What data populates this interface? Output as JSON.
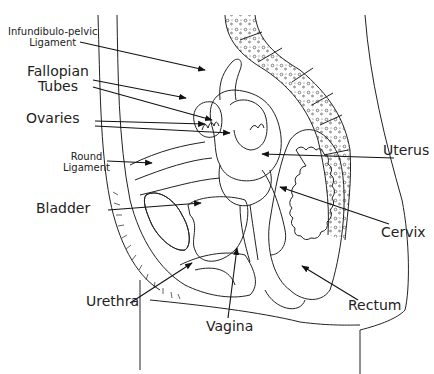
{
  "diagram": {
    "labels": {
      "infundibulo_line1": "Infundibulo-pelvic",
      "infundibulo_line2": "Ligament",
      "fallopian_line1": "Fallopian",
      "fallopian_line2": "Tubes",
      "ovaries": "Ovaries",
      "round_line1": "Round",
      "round_line2": "Ligament",
      "bladder": "Bladder",
      "urethra": "Urethra",
      "vagina": "Vagina",
      "uterus": "Uterus",
      "cervix": "Cervix",
      "rectum": "Rectum"
    },
    "stroke_color": "#222222",
    "background_color": "#ffffff"
  }
}
